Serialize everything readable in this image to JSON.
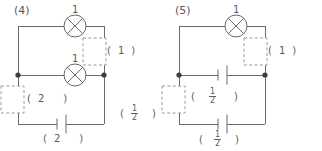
{
  "page": {
    "background_color": "#ffffff",
    "line_color": "#6a6a6a",
    "text_color": "#5a5a5a",
    "width": 322,
    "height": 151
  },
  "circuits": [
    {
      "id": "circuit-4",
      "label": "(4)",
      "components": {
        "top_lamp": {
          "symbol": "lamp",
          "value_above": "1"
        },
        "middle_lamp": {
          "symbol": "lamp",
          "value_above": "1"
        },
        "bottom_battery": {
          "symbol": "battery"
        }
      },
      "annotations": {
        "right_box": {
          "open": "(",
          "value": "1",
          "close": ")"
        },
        "left_box": {
          "open": "(",
          "value": "2",
          "close": ")"
        },
        "battery_value": {
          "open": "(",
          "value": "2",
          "close": ")"
        },
        "corner_value": {
          "open": "(",
          "num": "1",
          "den": "2",
          "close": ")"
        }
      }
    },
    {
      "id": "circuit-5",
      "label": "(5)",
      "components": {
        "top_lamp": {
          "symbol": "lamp",
          "value_above": "1"
        },
        "middle_battery": {
          "symbol": "battery"
        },
        "bottom_battery": {
          "symbol": "battery"
        }
      },
      "annotations": {
        "right_box": {
          "open": "(",
          "value": "1",
          "close": ")"
        },
        "middle_value": {
          "open": "(",
          "num": "1",
          "den": "2",
          "close": ")"
        },
        "battery_value": {
          "open": "(",
          "num": "1",
          "den": "2",
          "close": ")"
        }
      }
    }
  ]
}
